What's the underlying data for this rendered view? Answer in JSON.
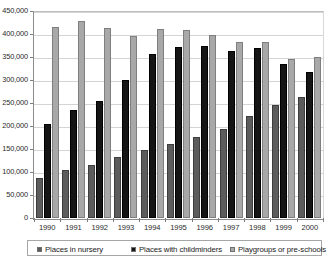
{
  "chart_data": {
    "type": "bar",
    "title": "",
    "subtitle": "",
    "xlabel": "",
    "ylabel": "",
    "categories": [
      "1990",
      "1991",
      "1992",
      "1993",
      "1994",
      "1995",
      "1996",
      "1997",
      "1998",
      "1999",
      "2000"
    ],
    "series": [
      {
        "name": "Places in nursery",
        "color": "#5c5c5c",
        "values": [
          87000,
          105000,
          116000,
          133000,
          148000,
          160000,
          177000,
          193000,
          222000,
          246000,
          262000
        ]
      },
      {
        "name": "Places with childminders",
        "color": "#151515",
        "values": [
          205000,
          234000,
          254000,
          300000,
          356000,
          372000,
          375000,
          364000,
          369000,
          335000,
          318000
        ]
      },
      {
        "name": "Playgroups or pre-schools",
        "color": "#a8a8a8",
        "values": [
          416000,
          428000,
          414000,
          396000,
          410000,
          409000,
          397000,
          382000,
          382000,
          345000,
          351000
        ]
      }
    ],
    "ylim": [
      0,
      450000
    ],
    "ytick_values": [
      0,
      50000,
      100000,
      150000,
      200000,
      250000,
      300000,
      350000,
      400000,
      450000
    ],
    "ytick_labels": [
      "0",
      "50,000",
      "100,000",
      "150,000",
      "200,000",
      "250,000",
      "300,000",
      "350,000",
      "400,000",
      "450,000"
    ],
    "grid": true,
    "grid_axis": "y",
    "legend_position": "bottom",
    "bar_grouping": "grouped"
  },
  "legend": {
    "entries": [
      {
        "label": "Places in nursery",
        "swatch": "legend-swatch-nursery"
      },
      {
        "label": "Places with childminders",
        "swatch": "legend-swatch-childminders"
      },
      {
        "label": "Playgroups or pre-schools",
        "swatch": "legend-swatch-playgroups"
      }
    ]
  },
  "colors": {
    "series_nursery": "#5c5c5c",
    "series_childminders": "#151515",
    "series_playgroups": "#a8a8a8",
    "gridline": "#d4d4d4",
    "axis": "#8c8c8c",
    "background": "#ffffff"
  }
}
